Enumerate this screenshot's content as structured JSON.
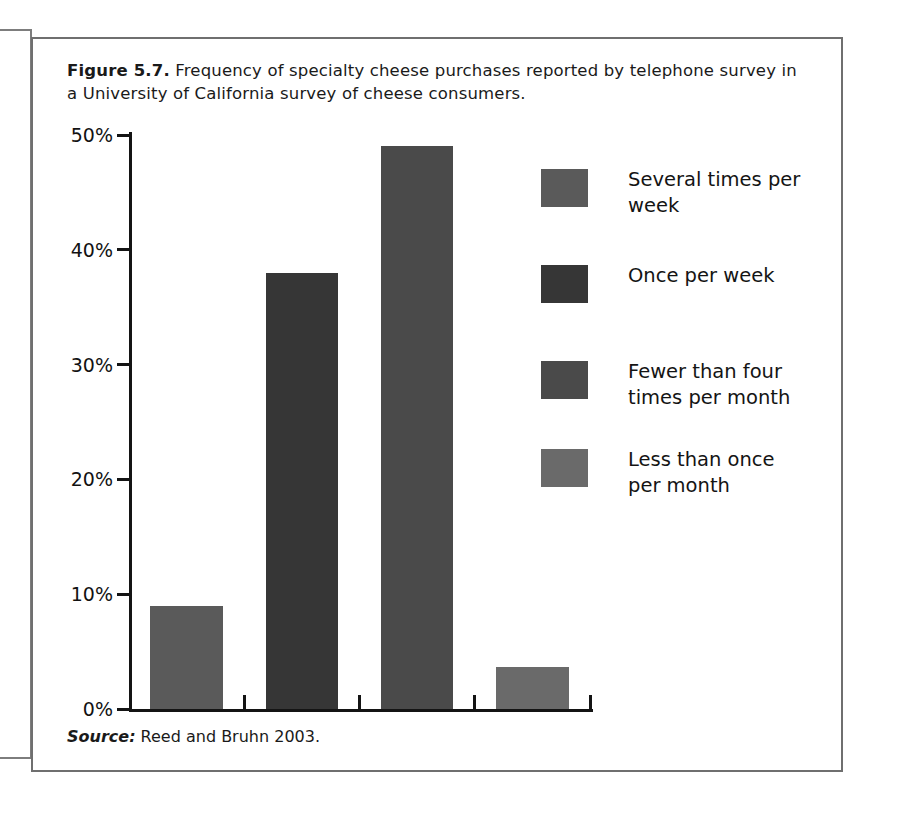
{
  "figure": {
    "label": "Figure 5.7.",
    "caption": " Frequency of specialty cheese purchases reported by telephone survey in a University of California survey of cheese consumers.",
    "source_label": "Source:",
    "source_text": " Reed and Bruhn 2003."
  },
  "chart_data": {
    "type": "bar",
    "title": "Frequency of specialty cheese purchases reported by telephone survey in a University of California survey of cheese consumers.",
    "categories": [
      "Several times per week",
      "Once per week",
      "Fewer than four times per month",
      "Less than once per month"
    ],
    "values": [
      9,
      38,
      49,
      3.7
    ],
    "value_labels": [
      "9%",
      "38%",
      "49%",
      "3.7%"
    ],
    "xlabel": "",
    "ylabel": "",
    "ylim": [
      0,
      50
    ],
    "ytick_values": [
      0,
      10,
      20,
      30,
      40,
      50
    ],
    "ytick_labels": [
      "0%",
      "10%",
      "20%",
      "30%",
      "40%",
      "50%"
    ],
    "grid": false,
    "legend_position": "right",
    "bar_colors": [
      "#5a5a5a",
      "#363636",
      "#4a4a4a",
      "#6a6a6a"
    ],
    "series": [
      {
        "name": "Share of respondents",
        "values": [
          9,
          38,
          49,
          3.7
        ]
      }
    ]
  },
  "legend": {
    "items": [
      {
        "label": "Several times per week",
        "color": "#5a5a5a"
      },
      {
        "label": "Once per week",
        "color": "#363636"
      },
      {
        "label": "Fewer than four\ntimes per month",
        "color": "#4a4a4a"
      },
      {
        "label": "Less than once\nper month",
        "color": "#6a6a6a"
      }
    ]
  }
}
